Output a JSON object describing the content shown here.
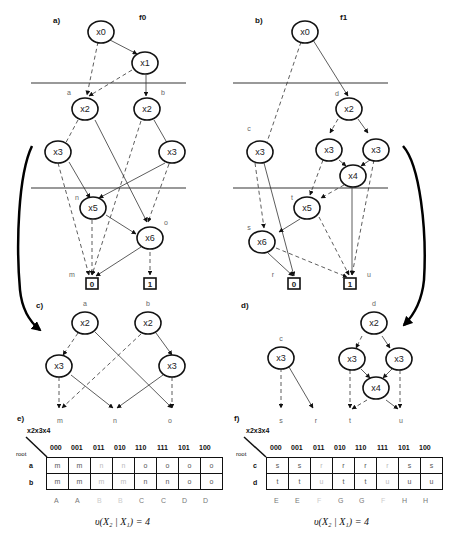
{
  "panels": {
    "a": {
      "label": "a)",
      "title": "f0"
    },
    "b": {
      "label": "b)",
      "title": "f1"
    },
    "c": {
      "label": "c)"
    },
    "d": {
      "label": "d)"
    },
    "e": {
      "label": "e)"
    },
    "f": {
      "label": "f)"
    }
  },
  "nodes": {
    "a_x0": "x0",
    "a_x1": "x1",
    "a_x2a": "x2",
    "a_x2b": "x2",
    "a_x3a": "x3",
    "a_x3b": "x3",
    "a_x5": "x5",
    "a_x6": "x6",
    "b_x0": "x0",
    "b_x2": "x2",
    "b_x3c": "x3",
    "b_x3d1": "x3",
    "b_x3d2": "x3",
    "b_x4": "x4",
    "b_x5": "x5",
    "b_x6": "x6",
    "c_x2a": "x2",
    "c_x2b": "x2",
    "c_x3a": "x3",
    "c_x3b": "x3",
    "d_x3c": "x3",
    "d_x2": "x2",
    "d_x3a": "x3",
    "d_x3b": "x3",
    "d_x4": "x4"
  },
  "terminals": {
    "a_0": "0",
    "a_1": "1",
    "b_0": "0",
    "b_1": "1"
  },
  "edge_labels": {
    "a_a": "a",
    "a_b": "b",
    "a_n": "n",
    "a_o": "o",
    "a_m": "m",
    "b_c": "c",
    "b_d": "d",
    "b_t": "t",
    "b_s": "s",
    "b_r": "r",
    "b_u": "u",
    "c_a": "a",
    "c_b": "b",
    "c_m": "m",
    "c_n": "n",
    "c_o": "o",
    "d_c": "c",
    "d_d": "d",
    "d_s": "s",
    "d_r": "r",
    "d_t": "t",
    "d_u": "u"
  },
  "table_e": {
    "corner": "x2x3x4",
    "root": "root",
    "columns": [
      "000",
      "001",
      "011",
      "010",
      "110",
      "111",
      "101",
      "100"
    ],
    "rows": [
      {
        "label": "a",
        "cells": [
          "m",
          "m",
          "n",
          "n",
          "o",
          "o",
          "o",
          "o"
        ]
      },
      {
        "label": "b",
        "cells": [
          "m",
          "m",
          "m",
          "m",
          "n",
          "n",
          "o",
          "o"
        ]
      }
    ],
    "classes": [
      "A",
      "A",
      "B",
      "B",
      "C",
      "C",
      "D",
      "D"
    ],
    "formula": "υ(X₂ | X₁) = 4"
  },
  "table_f": {
    "corner": "x2x3x4",
    "root": "root",
    "columns": [
      "000",
      "001",
      "011",
      "010",
      "110",
      "111",
      "101",
      "100"
    ],
    "rows": [
      {
        "label": "c",
        "cells": [
          "s",
          "s",
          "r",
          "r",
          "r",
          "r",
          "s",
          "s"
        ]
      },
      {
        "label": "d",
        "cells": [
          "t",
          "t",
          "u",
          "t",
          "t",
          "u",
          "u",
          "u"
        ]
      }
    ],
    "classes": [
      "E",
      "E",
      "F",
      "G",
      "G",
      "F",
      "H",
      "H"
    ],
    "formula": "υ(X₂ | X₁) = 4"
  }
}
